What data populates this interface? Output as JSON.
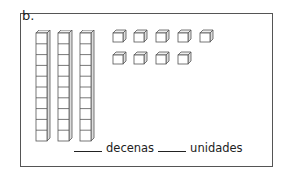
{
  "problem": {
    "label": "b.",
    "rods": {
      "count": 3,
      "cubes_per_rod": 10
    },
    "unit_cubes": {
      "rows": [
        5,
        4
      ],
      "total": 9
    },
    "answer_line": {
      "blank1": "_____",
      "tens_label": "decenas",
      "blank2": "_____",
      "units_label": "unidades"
    }
  },
  "colors": {
    "stroke": "#555555",
    "face": "#ffffff",
    "side": "#dddddd"
  }
}
